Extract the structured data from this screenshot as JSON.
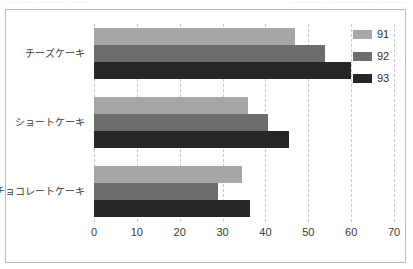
{
  "bleed": {
    "left_fragment": "― ―― ――― ――",
    "right_fragment": "―――― ――――― ―――"
  },
  "colors": {
    "series_91": "#a6a6a6",
    "series_92": "#6d6d6d",
    "series_93": "#262626",
    "gridline": "#c9c9c9",
    "frame_border": "#b9b9b9",
    "background": "#ffffff",
    "text": "#3a3a3a"
  },
  "legend": {
    "position": "top-right",
    "entries": [
      {
        "label": "91",
        "color": "#a6a6a6"
      },
      {
        "label": "92",
        "color": "#6d6d6d"
      },
      {
        "label": "93",
        "color": "#262626"
      }
    ]
  },
  "chart_data": {
    "type": "bar",
    "orientation": "horizontal",
    "title": "",
    "xlabel": "",
    "ylabel": "",
    "categories": [
      "チーズケーキ",
      "ショートケーキ",
      "チョコレートケーキ"
    ],
    "series": [
      {
        "name": "91",
        "color": "#a6a6a6",
        "values": [
          47,
          36,
          34.5
        ]
      },
      {
        "name": "92",
        "color": "#6d6d6d",
        "values": [
          54,
          40.5,
          29
        ]
      },
      {
        "name": "93",
        "color": "#262626",
        "values": [
          60,
          45.5,
          36.5
        ]
      }
    ],
    "xlim": [
      0,
      70
    ],
    "xticks": [
      0,
      10,
      20,
      30,
      40,
      50,
      60,
      70
    ],
    "xtick_labels": [
      "0",
      "10",
      "20",
      "30",
      "40",
      "50",
      "60",
      "70"
    ],
    "grid": true,
    "grid_axis": "x",
    "grid_style": "dashed",
    "legend_position": "upper right"
  }
}
